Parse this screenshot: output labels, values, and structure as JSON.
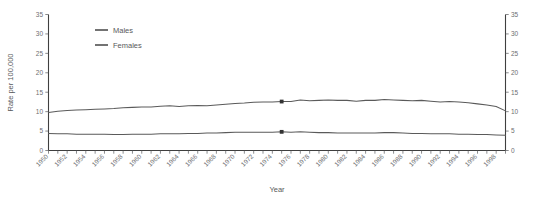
{
  "chart_data": {
    "type": "line",
    "title": "",
    "xlabel": "Year",
    "ylabel": "Rate per 100,000",
    "ylim": [
      0,
      35
    ],
    "xlim": [
      1950,
      1999
    ],
    "yticks": [
      0,
      5,
      10,
      15,
      20,
      25,
      30,
      35
    ],
    "ytick_labels": [
      "0",
      "5",
      "10",
      "15",
      "20",
      "25",
      "30",
      "35"
    ],
    "right_axis": true,
    "right_ytick_labels": [
      "0",
      "5",
      "10",
      "15",
      "20",
      "25",
      "30",
      "35"
    ],
    "grid": false,
    "legend_position": "top-left-inside",
    "xtick_labels": [
      "1950",
      "1952",
      "1954",
      "1956",
      "1958",
      "1960",
      "1962",
      "1964",
      "1966",
      "1968",
      "1970",
      "1972",
      "1974",
      "1976",
      "1978",
      "1980",
      "1982",
      "1984",
      "1986",
      "1988",
      "1990",
      "1992",
      "1994",
      "1996",
      "1998"
    ],
    "x": [
      1950,
      1951,
      1952,
      1953,
      1954,
      1955,
      1956,
      1957,
      1958,
      1959,
      1960,
      1961,
      1962,
      1963,
      1964,
      1965,
      1966,
      1967,
      1968,
      1969,
      1970,
      1971,
      1972,
      1973,
      1974,
      1975,
      1976,
      1977,
      1978,
      1979,
      1980,
      1981,
      1982,
      1983,
      1984,
      1985,
      1986,
      1987,
      1988,
      1989,
      1990,
      1991,
      1992,
      1993,
      1994,
      1995,
      1996,
      1997,
      1998,
      1999
    ],
    "series": [
      {
        "name": "Males",
        "color": "#5a5a5a",
        "values": [
          9.8,
          10.1,
          10.3,
          10.4,
          10.5,
          10.6,
          10.7,
          10.8,
          11.0,
          11.1,
          11.2,
          11.2,
          11.4,
          11.5,
          11.3,
          11.5,
          11.6,
          11.5,
          11.7,
          11.9,
          12.1,
          12.2,
          12.4,
          12.5,
          12.5,
          12.6,
          12.6,
          13.0,
          12.8,
          12.9,
          13.0,
          12.9,
          12.9,
          12.7,
          12.9,
          12.9,
          13.1,
          13.0,
          12.9,
          12.8,
          12.9,
          12.7,
          12.5,
          12.6,
          12.5,
          12.3,
          12.0,
          11.7,
          11.3,
          10.2
        ],
        "marker_points": [
          {
            "x": 1975,
            "y": 12.6
          }
        ]
      },
      {
        "name": "Females",
        "color": "#5a5a5a",
        "values": [
          4.4,
          4.3,
          4.3,
          4.2,
          4.2,
          4.2,
          4.2,
          4.1,
          4.1,
          4.2,
          4.2,
          4.2,
          4.3,
          4.3,
          4.3,
          4.4,
          4.4,
          4.5,
          4.5,
          4.6,
          4.7,
          4.7,
          4.7,
          4.7,
          4.7,
          4.8,
          4.7,
          4.8,
          4.7,
          4.6,
          4.6,
          4.5,
          4.5,
          4.5,
          4.5,
          4.5,
          4.6,
          4.6,
          4.5,
          4.4,
          4.4,
          4.3,
          4.3,
          4.3,
          4.2,
          4.2,
          4.1,
          4.1,
          4.0,
          3.9
        ],
        "marker_points": [
          {
            "x": 1975,
            "y": 4.8
          }
        ]
      }
    ]
  },
  "legend": {
    "items": [
      {
        "label": "Males",
        "color": "#5a5a5a"
      },
      {
        "label": "Females",
        "color": "#5a5a5a"
      }
    ]
  },
  "axes": {
    "left_title": "Rate per 100,000",
    "bottom_title": "Year"
  }
}
